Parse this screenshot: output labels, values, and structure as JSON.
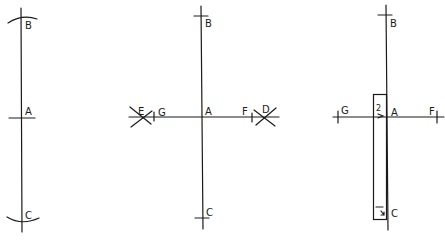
{
  "figures": [
    {
      "id": "figure-1",
      "description": "Vertical line with arcs marking equal distances from A",
      "labels": {
        "top": "B",
        "middle": "A",
        "bottom": "C"
      }
    },
    {
      "id": "figure-2",
      "description": "Perpendicular bisector construction through A with arc intersections",
      "labels": {
        "top": "B",
        "center": "A",
        "bottom": "C",
        "left_intersection": "E",
        "left_point": "G",
        "right_point": "F",
        "right_intersection": "D"
      }
    },
    {
      "id": "figure-3",
      "description": "Right angle at A checked with a rectangular square placed along AC",
      "labels": {
        "top": "B",
        "center": "A",
        "bottom": "C",
        "left_point": "G",
        "right_point": "F",
        "square_mark_top": "2",
        "square_mark_bottom": "1"
      }
    }
  ],
  "colors": {
    "ink": "#1a1a1a",
    "background": "#ffffff"
  }
}
